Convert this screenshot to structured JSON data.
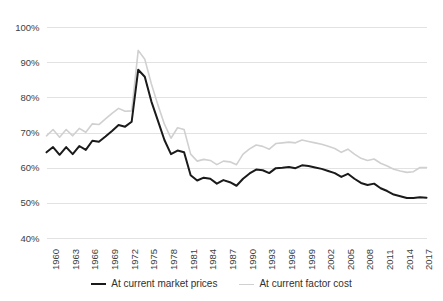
{
  "chart_data": {
    "type": "line",
    "title": "",
    "xlabel": "",
    "ylabel": "",
    "ylim": [
      40,
      100
    ],
    "ytick_labels": [
      "100%",
      "90%",
      "80%",
      "70%",
      "60%",
      "50%",
      "40%"
    ],
    "ytick_values": [
      100,
      90,
      80,
      70,
      60,
      50,
      40
    ],
    "grid": "horizontal",
    "legend_position": "bottom-center",
    "xtick_labels": [
      "1960",
      "1963",
      "1966",
      "1969",
      "1972",
      "1975",
      "1978",
      "1981",
      "1984",
      "1987",
      "1990",
      "1993",
      "1996",
      "1999",
      "2002",
      "2005",
      "2008",
      "2011",
      "2014",
      "2017"
    ],
    "x": [
      1960,
      1961,
      1962,
      1963,
      1964,
      1965,
      1966,
      1967,
      1968,
      1969,
      1970,
      1971,
      1972,
      1973,
      1974,
      1975,
      1976,
      1977,
      1978,
      1979,
      1980,
      1981,
      1982,
      1983,
      1984,
      1985,
      1986,
      1987,
      1988,
      1989,
      1990,
      1991,
      1992,
      1993,
      1994,
      1995,
      1996,
      1997,
      1998,
      1999,
      2000,
      2001,
      2002,
      2003,
      2004,
      2005,
      2006,
      2007,
      2008,
      2009,
      2010,
      2011,
      2012,
      2013,
      2014,
      2015,
      2016,
      2017,
      2018
    ],
    "series": [
      {
        "name": "At current market prices",
        "color": "#1a1a1a",
        "width": 2.0,
        "values": [
          64.5,
          66.0,
          63.8,
          66.0,
          64.0,
          66.3,
          65.2,
          67.8,
          67.5,
          69.0,
          70.6,
          72.3,
          71.8,
          73.2,
          88.0,
          86.0,
          79.0,
          73.5,
          68.0,
          64.0,
          65.0,
          64.5,
          58.0,
          56.5,
          57.3,
          57.0,
          55.6,
          56.6,
          56.0,
          55.0,
          57.0,
          58.5,
          59.6,
          59.4,
          58.6,
          60.0,
          60.1,
          60.3,
          60.0,
          60.8,
          60.6,
          60.2,
          59.8,
          59.2,
          58.6,
          57.5,
          58.4,
          57.0,
          55.8,
          55.2,
          55.6,
          54.3,
          53.5,
          52.5,
          52.0,
          51.5,
          51.5,
          51.7,
          51.6
        ]
      },
      {
        "name": "At current factor cost",
        "color": "#d0d0d0",
        "width": 1.6,
        "values": [
          69.2,
          71.0,
          68.8,
          71.0,
          69.2,
          71.3,
          70.2,
          72.6,
          72.4,
          74.0,
          75.6,
          77.0,
          76.2,
          76.3,
          93.5,
          91.0,
          84.0,
          78.0,
          72.5,
          68.5,
          71.5,
          71.0,
          64.0,
          62.0,
          62.5,
          62.2,
          61.0,
          62.0,
          61.8,
          61.0,
          64.0,
          65.5,
          66.6,
          66.2,
          65.4,
          67.0,
          67.2,
          67.4,
          67.2,
          68.0,
          67.6,
          67.2,
          66.8,
          66.2,
          65.6,
          64.5,
          65.4,
          64.0,
          62.8,
          62.2,
          62.6,
          61.4,
          60.6,
          59.7,
          59.2,
          58.8,
          59.0,
          60.2,
          60.2
        ]
      }
    ]
  },
  "legend": {
    "entries": [
      {
        "label": "At current market prices",
        "color": "#1a1a1a"
      },
      {
        "label": "At current factor cost",
        "color": "#d0d0d0"
      }
    ]
  }
}
